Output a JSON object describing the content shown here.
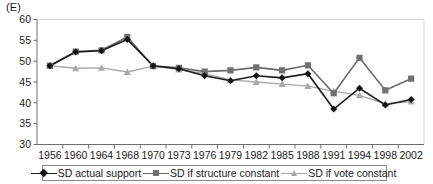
{
  "panel": {
    "label": "(E)"
  },
  "legend": {
    "entries": [
      {
        "label": "SD actual support",
        "marker": "diamond-marker",
        "color": "#151515"
      },
      {
        "label": "SD if structure constant",
        "marker": "square-marker",
        "color": "#707070"
      },
      {
        "label": "SD if vote constant",
        "marker": "triangle-marker",
        "color": "#a9a9a9"
      }
    ]
  },
  "axes": {
    "y_ticks": [
      "30",
      "35",
      "40",
      "45",
      "50",
      "55",
      "60"
    ],
    "x_ticks": [
      "1956",
      "1960",
      "1964",
      "1968",
      "1970",
      "1973",
      "1976",
      "1979",
      "1982",
      "1985",
      "1988",
      "1991",
      "1994",
      "1998",
      "2002"
    ]
  },
  "chart_data": {
    "type": "line",
    "title": "(E)",
    "xlabel": "",
    "ylabel": "",
    "ylim": [
      30,
      60
    ],
    "ytick_step": 5,
    "grid": false,
    "legend_position": "bottom",
    "categories": [
      "1956",
      "1960",
      "1964",
      "1968",
      "1970",
      "1973",
      "1976",
      "1979",
      "1982",
      "1985",
      "1988",
      "1991",
      "1994",
      "1998",
      "2002"
    ],
    "series": [
      {
        "name": "SD actual support",
        "marker": "diamond",
        "color": "#151515",
        "values": [
          48.9,
          52.2,
          52.5,
          55.2,
          48.9,
          48.2,
          46.5,
          45.3,
          46.5,
          46.0,
          47.0,
          38.5,
          43.5,
          39.5,
          40.8
        ]
      },
      {
        "name": "SD if structure constant",
        "marker": "square",
        "color": "#707070",
        "values": [
          48.9,
          52.3,
          52.6,
          55.8,
          48.8,
          48.4,
          47.5,
          47.8,
          48.5,
          47.8,
          49.0,
          42.3,
          50.8,
          43.0,
          45.8
        ]
      },
      {
        "name": "SD if vote constant",
        "marker": "triangle",
        "color": "#a9a9a9",
        "values": [
          48.9,
          48.3,
          48.4,
          47.4,
          48.8,
          48.0,
          47.0,
          45.5,
          45.0,
          44.5,
          44.0,
          42.8,
          41.8,
          39.8,
          40.3
        ]
      }
    ]
  }
}
